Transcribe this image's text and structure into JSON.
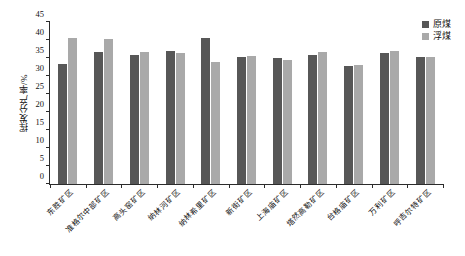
{
  "chart_data": {
    "type": "bar",
    "title": "",
    "xlabel": "",
    "ylabel": "挥发分产率/%",
    "ylim": [
      0,
      45
    ],
    "yticks": [
      0,
      5,
      10,
      15,
      20,
      25,
      30,
      35,
      40,
      45
    ],
    "grid": false,
    "legend_position": "top-right",
    "categories": [
      "东胜矿区",
      "准格尔中部矿区",
      "高头窑矿区",
      "纳林河矿区",
      "纳林希里矿区",
      "新街矿区",
      "上海庙矿区",
      "塔然高勒矿区",
      "台格庙矿区",
      "万利矿区",
      "呼吉尔特矿区"
    ],
    "series": [
      {
        "name": "原煤",
        "color": "#575757",
        "values": [
          33.2,
          36.6,
          35.7,
          37.0,
          40.6,
          35.4,
          35.0,
          35.8,
          32.9,
          36.4,
          35.4
        ]
      },
      {
        "name": "浮煤",
        "color": "#a9a9a9",
        "values": [
          40.5,
          40.2,
          36.6,
          36.5,
          34.0,
          35.5,
          34.5,
          36.7,
          33.0,
          37.0,
          35.4
        ]
      }
    ]
  }
}
